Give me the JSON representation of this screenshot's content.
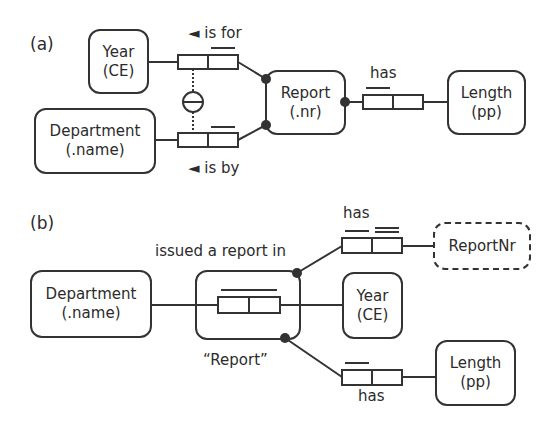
{
  "panel_a": {
    "label": "(a)",
    "entities": {
      "year": {
        "name": "Year",
        "ref": "(CE)"
      },
      "department": {
        "name": "Department",
        "ref": "(.name)"
      },
      "report": {
        "name": "Report",
        "ref": "(.nr)"
      },
      "length": {
        "name": "Length",
        "ref": "(pp)"
      }
    },
    "fact_types": {
      "is_for": {
        "reading": "◄ is for"
      },
      "is_by": {
        "reading": "◄ is by"
      },
      "has": {
        "reading": "has"
      }
    }
  },
  "panel_b": {
    "label": "(b)",
    "entities": {
      "department": {
        "name": "Department",
        "ref": "(.name)"
      },
      "year": {
        "name": "Year",
        "ref": "(CE)"
      },
      "report_nr": {
        "name": "ReportNr"
      },
      "length": {
        "name": "Length",
        "ref": "(pp)"
      }
    },
    "objectified": {
      "reading": "issued a report in",
      "name": "“Report”"
    },
    "fact_types": {
      "has_report_nr": {
        "reading": "has"
      },
      "has_length": {
        "reading": "has"
      }
    }
  },
  "colors": {
    "stroke": "#333333",
    "text": "#2b2b2b",
    "background": "#ffffff"
  }
}
